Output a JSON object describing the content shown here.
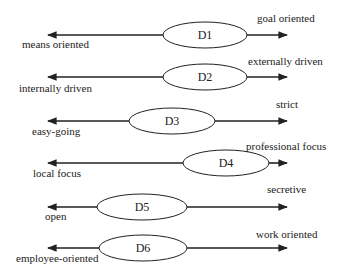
{
  "diagram": {
    "type": "bipolar-dimension-scales",
    "colors": {
      "line": "#222222",
      "fill": "#ffffff",
      "text": "#222222"
    },
    "dimensions": [
      {
        "id": "D1",
        "left_label": "means oriented",
        "right_label": "goal oriented",
        "y": 35,
        "ellipse_cx": 205,
        "ellipse_rx": 42,
        "left_label_x": 22,
        "left_label_y": 48,
        "right_label_x": 257,
        "right_label_y": 22
      },
      {
        "id": "D2",
        "left_label": "internally driven",
        "right_label": "externally driven",
        "y": 77,
        "ellipse_cx": 205,
        "ellipse_rx": 42,
        "left_label_x": 19,
        "left_label_y": 92,
        "right_label_x": 248,
        "right_label_y": 65
      },
      {
        "id": "D3",
        "left_label": "easy-going",
        "right_label": "strict",
        "y": 121,
        "ellipse_cx": 172,
        "ellipse_rx": 43,
        "left_label_x": 32,
        "left_label_y": 135,
        "right_label_x": 276,
        "right_label_y": 108
      },
      {
        "id": "D4",
        "left_label": "local focus",
        "right_label": "professional focus",
        "y": 163,
        "ellipse_cx": 226,
        "ellipse_rx": 43,
        "left_label_x": 33,
        "left_label_y": 177,
        "right_label_x": 246,
        "right_label_y": 150
      },
      {
        "id": "D5",
        "left_label": "open",
        "right_label": "secretive",
        "y": 207,
        "ellipse_cx": 142,
        "ellipse_rx": 45,
        "left_label_x": 45,
        "left_label_y": 220,
        "right_label_x": 267,
        "right_label_y": 193
      },
      {
        "id": "D6",
        "left_label": "employee-oriented",
        "right_label": "work oriented",
        "y": 248,
        "ellipse_cx": 143,
        "ellipse_rx": 44,
        "left_label_x": 16,
        "left_label_y": 262,
        "right_label_x": 256,
        "right_label_y": 238
      }
    ],
    "arrow_left_x": 48,
    "arrow_right_x": 287,
    "ellipse_ry": 13
  }
}
